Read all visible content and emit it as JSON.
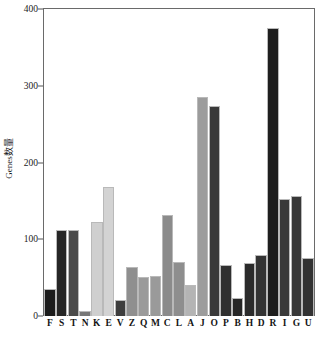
{
  "chart_data": {
    "type": "bar",
    "title": "",
    "subtitle": "",
    "xlabel": "",
    "ylabel": "Genes数量",
    "ylim": [
      0,
      400
    ],
    "yticks": [
      0,
      100,
      200,
      300,
      400
    ],
    "ytick_labels": [
      "0",
      "100",
      "200",
      "300",
      "400"
    ],
    "grid": false,
    "legend": "none",
    "categories": [
      "F",
      "S",
      "T",
      "N",
      "K",
      "E",
      "V",
      "Z",
      "Q",
      "M",
      "C",
      "L",
      "A",
      "J",
      "O",
      "P",
      "B",
      "H",
      "D",
      "R",
      "I",
      "G",
      "U"
    ],
    "values": [
      35,
      112,
      112,
      7,
      122,
      168,
      21,
      64,
      51,
      52,
      132,
      70,
      40,
      285,
      273,
      66,
      24,
      69,
      80,
      375,
      152,
      157,
      76
    ],
    "bar_colors": [
      "#1c1c1c",
      "#262626",
      "#4a4a4a",
      "#777777",
      "#cfcfcf",
      "#d3d3d3",
      "#3d3d3d",
      "#8f8f8f",
      "#9a9a9a",
      "#9a9a9a",
      "#8b8b8b",
      "#8e8e8e",
      "#b4b4b4",
      "#9c9c9c",
      "#3a3a3a",
      "#303030",
      "#262626",
      "#2b2b2b",
      "#333333",
      "#1e1e1e",
      "#3a3a3a",
      "#383838",
      "#323232"
    ]
  },
  "axes": {
    "frame_color": "#6a6a6a",
    "tick_color": "#555555",
    "text_color": "#1a1a1a"
  }
}
